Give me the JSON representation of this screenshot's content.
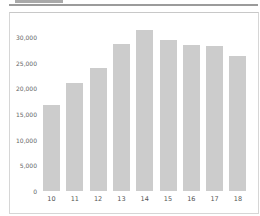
{
  "chart_data": {
    "type": "bar",
    "title": "",
    "xlabel": "",
    "ylabel": "",
    "categories": [
      "10",
      "11",
      "12",
      "13",
      "14",
      "15",
      "16",
      "17",
      "18"
    ],
    "values": [
      16800,
      21000,
      24000,
      28600,
      31400,
      29400,
      28400,
      28300,
      26300
    ],
    "ylim": [
      0,
      30000
    ],
    "yticks": [
      0,
      5000,
      10000,
      15000,
      20000,
      25000,
      30000
    ],
    "ytick_labels": [
      "0",
      "5,000",
      "10,000",
      "15,000",
      "20,000",
      "25,000",
      "30,000"
    ],
    "grid": false,
    "legend": null,
    "bar_color": "#cccccc"
  }
}
